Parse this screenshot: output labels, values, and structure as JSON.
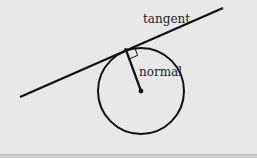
{
  "diagram": {
    "labels": {
      "tangent": "tangent",
      "normal": "normal"
    },
    "circle": {
      "cx": 141,
      "cy": 91,
      "r": 43
    },
    "tangent_line": {
      "x1": 20,
      "y1": 97,
      "x2": 223,
      "y2": 8
    },
    "tangent_point": {
      "x": 126,
      "y": 50
    },
    "normal_line": {
      "x1": 126,
      "y1": 50,
      "x2": 141,
      "y2": 91
    },
    "right_angle_marker": true,
    "colors": {
      "stroke": "#111111",
      "background": "#e8e8e8"
    }
  }
}
